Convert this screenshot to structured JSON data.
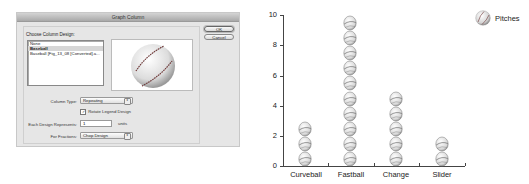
{
  "dialog": {
    "title": "Graph Column",
    "group_label": "Choose Column Design:",
    "designs": [
      {
        "label": "None",
        "selected": false
      },
      {
        "label": "Baseball",
        "selected": true
      },
      {
        "label": "Baseball [Fig_13_08 [Converted].a...",
        "selected": false
      }
    ],
    "preview_icon": "baseball-icon",
    "column_type_label": "Column Type:",
    "column_type_value": "Repeating",
    "rotate_legend_label": "Rotate Legend Design",
    "rotate_legend_checked": true,
    "each_design_label": "Each Design Represents:",
    "each_design_value": "1",
    "units_label": "units",
    "fractions_label": "For Fractions:",
    "fractions_value": "Chop Design",
    "ok_label": "OK",
    "cancel_label": "Cancel",
    "select_arrow_glyph": "⇕",
    "check_glyph": "✓"
  },
  "chart": {
    "legend_label": "Pitches",
    "y_ticks": [
      "0",
      "2",
      "4",
      "6",
      "8",
      "10"
    ]
  },
  "chart_data": {
    "type": "bar",
    "style": "pictograph (stacked repeating baseball icons, 1 icon = 1 unit)",
    "title": "",
    "categories": [
      "Curveball",
      "Fastball",
      "Change",
      "Slider"
    ],
    "series": [
      {
        "name": "Pitches",
        "values": [
          3,
          10,
          5,
          2
        ]
      }
    ],
    "xlabel": "",
    "ylabel": "",
    "ylim": [
      0,
      10
    ],
    "y_ticks": [
      0,
      2,
      4,
      6,
      8,
      10
    ],
    "grid": false,
    "legend_position": "top-right"
  }
}
